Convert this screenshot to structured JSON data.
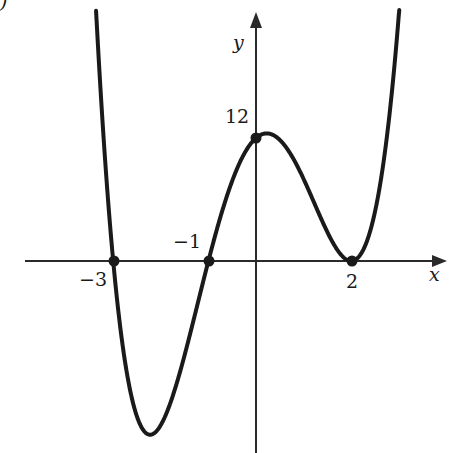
{
  "chart_data": {
    "type": "line",
    "title": "",
    "function": "f(x) = (x+3)(x+1)(x-2)^2",
    "xlabel": "x",
    "ylabel": "y",
    "x_tick_labels": [
      "−3",
      "−1",
      "2"
    ],
    "y_tick_labels": [
      "12"
    ],
    "xlim": [
      -5.0,
      4.0
    ],
    "ylim": [
      -18.5,
      24.5
    ],
    "grid": false,
    "legend": null,
    "marked_points": [
      {
        "x": -3,
        "y": 0,
        "label": "−3"
      },
      {
        "x": -1,
        "y": 0,
        "label": "−1"
      },
      {
        "x": 0,
        "y": 12,
        "label": "12"
      },
      {
        "x": 2,
        "y": 0,
        "label": "2"
      }
    ],
    "series": [
      {
        "name": "f(x)",
        "x": [
          -3.4,
          -3.2,
          -3.0,
          -2.8,
          -2.6,
          -2.4,
          -2.2,
          -2.0,
          -1.8,
          -1.6,
          -1.4,
          -1.2,
          -1.0,
          -0.8,
          -0.6,
          -0.4,
          -0.2,
          0.0,
          0.2,
          0.4,
          0.6,
          0.8,
          1.0,
          1.2,
          1.4,
          1.6,
          1.8,
          2.0,
          2.2,
          2.4,
          2.6,
          2.8,
          3.0
        ],
        "values": [
          27.7,
          12.5,
          0.0,
          -9.9,
          -15.2,
          -16.9,
          -16.9,
          -16.0,
          -13.8,
          -10.5,
          -6.6,
          -2.8,
          0.0,
          2.1,
          5.3,
          8.4,
          10.7,
          12.0,
          12.4,
          11.8,
          10.4,
          8.4,
          6.0,
          3.6,
          1.7,
          0.5,
          0.06,
          0.0,
          0.2,
          0.97,
          2.2,
          4.2,
          24.0
        ]
      }
    ],
    "local_extrema": [
      {
        "type": "min",
        "x": -2.2,
        "y": -16.9
      },
      {
        "type": "max",
        "x": 0.3,
        "y": 12.4
      },
      {
        "type": "min",
        "x": 2.0,
        "y": 0.0
      }
    ]
  },
  "labels": {
    "x_axis": "x",
    "y_axis": "y",
    "tick_neg3": "−3",
    "tick_neg1": "−1",
    "tick_2": "2",
    "tick_12": "12",
    "partial_corner": ")"
  },
  "colors": {
    "curve": "#1a1a1a",
    "axes": "#2a2a2a",
    "background": "#ffffff"
  }
}
